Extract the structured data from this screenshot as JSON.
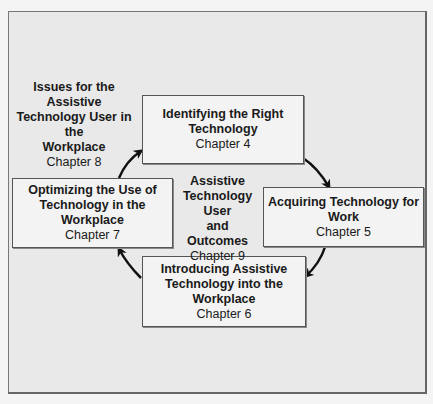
{
  "diagram": {
    "center": {
      "title_lines": [
        "Assistive",
        "Technology",
        "User",
        "and",
        "Outcomes"
      ],
      "chapter": "Chapter 9"
    },
    "outside_note": {
      "title_lines": [
        "Issues for the Assistive",
        "Technology User in the",
        "Workplace"
      ],
      "chapter": "Chapter 8"
    },
    "cycle": [
      {
        "title_lines": [
          "Identifying the Right",
          "Technology"
        ],
        "chapter": "Chapter 4"
      },
      {
        "title_lines": [
          "Acquiring Technology for",
          "Work"
        ],
        "chapter": "Chapter 5"
      },
      {
        "title_lines": [
          "Introducing Assistive",
          "Technology into the",
          "Workplace"
        ],
        "chapter": "Chapter 6"
      },
      {
        "title_lines": [
          "Optimizing the Use of",
          "Technology in the",
          "Workplace"
        ],
        "chapter": "Chapter 7"
      }
    ],
    "flow": [
      "Chapter 4 -> Chapter 5",
      "Chapter 5 -> Chapter 6",
      "Chapter 6 -> Chapter 7",
      "Chapter 7 -> Chapter 4"
    ]
  }
}
